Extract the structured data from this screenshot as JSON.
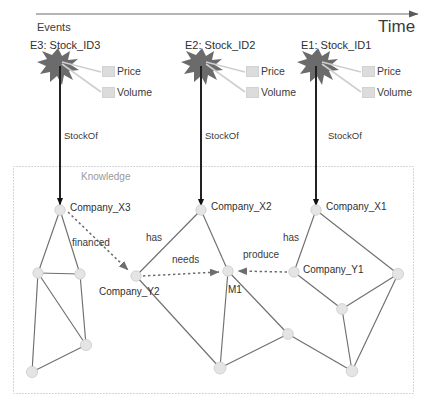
{
  "timeline": {
    "axis_label": "Time",
    "section_label": "Events",
    "arrow_color": "#5a5a5a"
  },
  "knowledge": {
    "box_label": "Knowledge",
    "border_color": "#b9b9b9",
    "border_style": "dotted"
  },
  "relation_label": "StockOf",
  "events": [
    {
      "id": "E3",
      "title": "E3: Stock_ID3",
      "attributes": [
        "Price",
        "Volume"
      ],
      "relation": "StockOf",
      "target": "Company_X3",
      "burst_color": "#6b6b6b"
    },
    {
      "id": "E2",
      "title": "E2: Stock_ID2",
      "attributes": [
        "Price",
        "Volume"
      ],
      "relation": "StockOf",
      "target": "Company_X2",
      "burst_color": "#6b6b6b"
    },
    {
      "id": "E1",
      "title": "E1: Stock_ID1",
      "attributes": [
        "Price",
        "Volume"
      ],
      "relation": "StockOf",
      "target": "Company_X1",
      "burst_color": "#6b6b6b"
    }
  ],
  "graph": {
    "named_nodes": [
      {
        "key": "X3",
        "label": "Company_X3"
      },
      {
        "key": "X2",
        "label": "Company_X2"
      },
      {
        "key": "X1",
        "label": "Company_X1"
      },
      {
        "key": "Y2",
        "label": "Company_Y2"
      },
      {
        "key": "Y1",
        "label": "Company_Y1"
      },
      {
        "key": "M1",
        "label": "M1"
      }
    ],
    "relations": [
      {
        "key": "financed",
        "label": "financed",
        "from": "Company_X3",
        "to": "Company_Y2",
        "style": "dotted"
      },
      {
        "key": "has_x2",
        "label": "has",
        "from": "Company_X2",
        "to": "Company_Y2",
        "style": "solid"
      },
      {
        "key": "needs",
        "label": "needs",
        "from": "Company_Y2",
        "to": "M1",
        "style": "dotted"
      },
      {
        "key": "produce",
        "label": "produce",
        "from": "Company_Y1",
        "to": "M1",
        "style": "dotted"
      },
      {
        "key": "has_x1",
        "label": "has",
        "from": "Company_X1",
        "to": "Company_Y1",
        "style": "solid"
      }
    ],
    "node_color": "#e2e2e2",
    "edge_color": "#6f6f6f"
  }
}
